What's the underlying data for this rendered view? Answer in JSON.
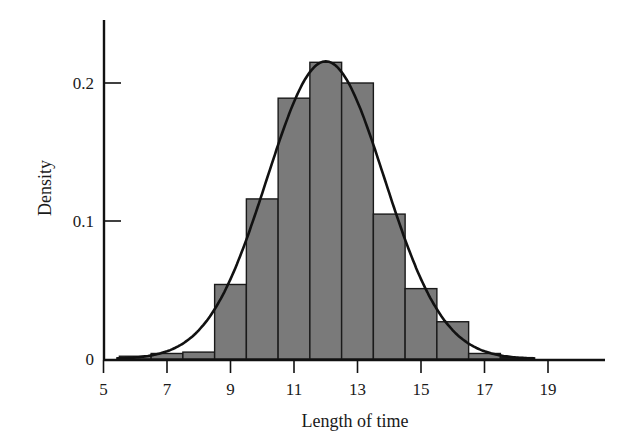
{
  "chart_data": {
    "type": "bar",
    "subtype": "histogram-with-density-curve",
    "title": "",
    "xlabel": "Length of time",
    "ylabel": "Density",
    "xlim": [
      5,
      21
    ],
    "ylim": [
      0,
      0.25
    ],
    "x_ticks": [
      5,
      7,
      9,
      11,
      13,
      15,
      17,
      19
    ],
    "x_tick_labels": [
      "5",
      "7",
      "9",
      "11",
      "13",
      "15",
      "17",
      "19"
    ],
    "y_ticks": [
      0,
      0.1,
      0.2
    ],
    "y_tick_labels": [
      "0",
      "0.1",
      "0.2"
    ],
    "bin_width": 1,
    "categories": [
      6,
      7,
      8,
      9,
      10,
      11,
      12,
      13,
      14,
      15,
      16,
      17,
      18
    ],
    "values": [
      0.002,
      0.004,
      0.005,
      0.054,
      0.116,
      0.189,
      0.215,
      0.2,
      0.105,
      0.051,
      0.027,
      0.004,
      0.001
    ],
    "curve": {
      "type": "normal",
      "mean": 12,
      "sd": 1.85,
      "x_range": [
        5.4,
        18.6
      ]
    },
    "grid": false,
    "legend": null,
    "colors": {
      "bar_fill": "#7a7a7a",
      "bar_edge": "#1a1a1a",
      "curve": "#111111",
      "axis": "#111111"
    }
  }
}
